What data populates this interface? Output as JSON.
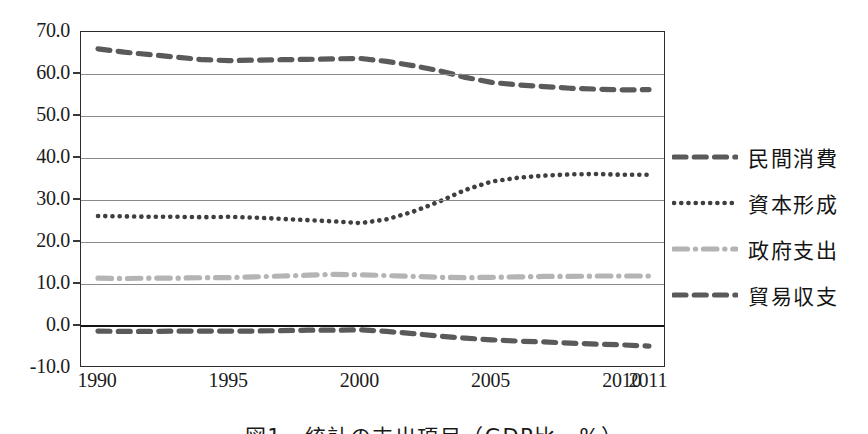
{
  "chart_data": {
    "type": "line",
    "title": "",
    "xlabel": "",
    "ylabel": "",
    "ylim": [
      -10.0,
      70.0
    ],
    "ytick_step": 10.0,
    "ytick_labels": [
      "70.0",
      "60.0",
      "50.0",
      "40.0",
      "30.0",
      "20.0",
      "10.0",
      "0.0",
      "-10.0"
    ],
    "ytick_values": [
      70.0,
      60.0,
      50.0,
      40.0,
      30.0,
      20.0,
      10.0,
      0.0,
      -10.0
    ],
    "grid": true,
    "legend_position": "right",
    "x": [
      1990,
      1991,
      1992,
      1993,
      1994,
      1995,
      1996,
      1997,
      1998,
      1999,
      2000,
      2001,
      2002,
      2003,
      2004,
      2005,
      2006,
      2007,
      2008,
      2009,
      2010,
      2011
    ],
    "xtick_labels": [
      "1990",
      "1995",
      "2000",
      "2005",
      "2010",
      "2011"
    ],
    "xtick_values": [
      1990,
      1995,
      2000,
      2005,
      2010,
      2011
    ],
    "series": [
      {
        "name": "民間消費",
        "style": "dashed",
        "color": "#5a5a5a",
        "values": [
          66.0,
          65.2,
          64.6,
          64.0,
          63.4,
          63.2,
          63.3,
          63.4,
          63.5,
          63.6,
          63.7,
          63.0,
          62.0,
          60.8,
          59.2,
          58.0,
          57.4,
          57.0,
          56.6,
          56.4,
          56.2,
          56.3
        ]
      },
      {
        "name": "資本形成",
        "style": "dotted",
        "color": "#3f3f3f",
        "values": [
          26.2,
          26.1,
          26.0,
          26.0,
          25.9,
          26.0,
          25.8,
          25.5,
          25.2,
          24.9,
          24.5,
          25.4,
          27.2,
          29.6,
          32.4,
          34.4,
          35.3,
          35.8,
          36.1,
          36.2,
          36.0,
          36.0
        ]
      },
      {
        "name": "政府支出",
        "style": "dash-dot",
        "color": "#b4b4b4",
        "values": [
          11.4,
          11.3,
          11.4,
          11.4,
          11.5,
          11.5,
          11.7,
          11.9,
          12.1,
          12.3,
          12.2,
          12.0,
          11.8,
          11.6,
          11.5,
          11.6,
          11.7,
          11.8,
          11.8,
          11.9,
          11.9,
          11.9
        ]
      },
      {
        "name": "貿易収支",
        "style": "dashed",
        "color": "#5a5a5a",
        "values": [
          -1.2,
          -1.3,
          -1.3,
          -1.2,
          -1.2,
          -1.2,
          -1.2,
          -1.1,
          -1.0,
          -1.0,
          -0.9,
          -1.3,
          -1.8,
          -2.4,
          -2.9,
          -3.3,
          -3.6,
          -3.8,
          -4.1,
          -4.3,
          -4.5,
          -4.8
        ]
      }
    ]
  },
  "legend": {
    "items": [
      {
        "label": "民間消費"
      },
      {
        "label": "資本形成"
      },
      {
        "label": "政府支出"
      },
      {
        "label": "貿易収支"
      }
    ]
  },
  "caption": {
    "text": "図1　統計の支出項目（GDP比、%）"
  }
}
